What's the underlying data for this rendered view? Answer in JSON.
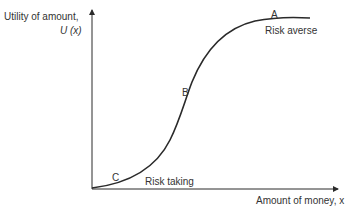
{
  "diagram": {
    "y_axis": {
      "label": "Utility of amount,",
      "symbol": "U (x)"
    },
    "x_axis": {
      "label": "Amount of money, x"
    },
    "points": [
      {
        "id": "A",
        "label": "A",
        "description": "Risk averse"
      },
      {
        "id": "B",
        "label": "B"
      },
      {
        "id": "C",
        "label": "C",
        "description": "Risk taking"
      }
    ],
    "curve": "S-shaped utility curve: convex (risk taking) at low amounts, concave (risk averse) at high amounts",
    "colors": {
      "line": "#2a2a2a",
      "text": "#333333",
      "background": "#ffffff"
    }
  }
}
